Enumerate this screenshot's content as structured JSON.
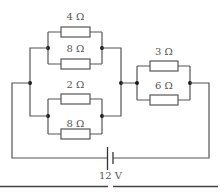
{
  "diagram": {
    "type": "circuit",
    "colors": {
      "wire": "#555555",
      "node": "#1a1a1a",
      "background": "#ffffff"
    },
    "battery": {
      "label": "12 V",
      "voltage": 12,
      "unit": "V"
    },
    "resistors": [
      {
        "id": "R1",
        "label": "4 Ω",
        "ohms": 4,
        "group": "upper-parallel-A"
      },
      {
        "id": "R2",
        "label": "8 Ω",
        "ohms": 8,
        "group": "upper-parallel-A"
      },
      {
        "id": "R3",
        "label": "2 Ω",
        "ohms": 2,
        "group": "lower-parallel-B"
      },
      {
        "id": "R4",
        "label": "8 Ω",
        "ohms": 8,
        "group": "lower-parallel-B"
      },
      {
        "id": "R5",
        "label": "3 Ω",
        "ohms": 3,
        "group": "right-parallel-C"
      },
      {
        "id": "R6",
        "label": "6 Ω",
        "ohms": 6,
        "group": "right-parallel-C"
      }
    ],
    "topology": "(4Ω ∥ 8Ω) ∥ (2Ω ∥ 8Ω), in series with (3Ω ∥ 6Ω), across 12 V battery"
  }
}
